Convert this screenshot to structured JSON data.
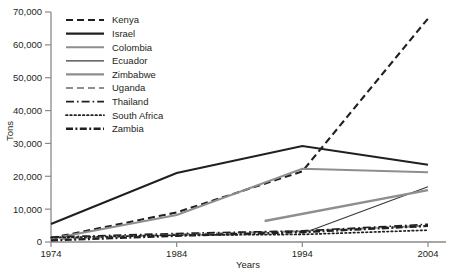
{
  "chart_data": {
    "type": "line",
    "title": "",
    "xlabel": "Years",
    "ylabel": "Tons",
    "xlim": [
      1974,
      2004
    ],
    "ylim": [
      0,
      70000
    ],
    "grid": false,
    "legend_position": "top-left-inside",
    "xticks": [
      "1974",
      "1984",
      "1994",
      "2004"
    ],
    "xtick_values": [
      1974,
      1984,
      1994,
      2004
    ],
    "yticks": [
      "0",
      "10,000",
      "20,000",
      "30,000",
      "40,000",
      "50,000",
      "60,000",
      "70,000"
    ],
    "ytick_values": [
      0,
      10000,
      20000,
      30000,
      40000,
      50000,
      60000,
      70000
    ],
    "series": [
      {
        "name": "Kenya",
        "style": "dashed",
        "color": "#231f20",
        "width": 2.1,
        "x": [
          1974,
          1984,
          1994,
          2004
        ],
        "values": [
          1200,
          9000,
          21500,
          68000
        ]
      },
      {
        "name": "Israel",
        "style": "solid",
        "color": "#231f20",
        "width": 2.1,
        "x": [
          1974,
          1984,
          1994,
          2004
        ],
        "values": [
          5500,
          21000,
          29200,
          23500
        ]
      },
      {
        "name": "Colombia",
        "style": "solid",
        "color": "#8e8e8e",
        "width": 2.0,
        "x": [
          1974,
          1984,
          1994,
          2004
        ],
        "values": [
          1000,
          8200,
          22300,
          21200
        ]
      },
      {
        "name": "Ecuador",
        "style": "solid",
        "color": "#3a3a3a",
        "width": 1.2,
        "x": [
          1994,
          2004
        ],
        "values": [
          2600,
          16800
        ]
      },
      {
        "name": "Zimbabwe",
        "style": "solid",
        "color": "#8e8e8e",
        "width": 2.4,
        "x": [
          1991,
          2004
        ],
        "values": [
          6400,
          15800
        ]
      },
      {
        "name": "Uganda",
        "style": "dashed",
        "color": "#8e8e8e",
        "width": 2.0,
        "x": [
          1974,
          1984,
          1994,
          2004
        ],
        "values": [
          900,
          2300,
          3300,
          5000
        ]
      },
      {
        "name": "Thailand",
        "style": "dash-dot",
        "color": "#231f20",
        "width": 1.6,
        "x": [
          1974,
          1984,
          1994,
          2004
        ],
        "values": [
          1500,
          2600,
          3400,
          5400
        ]
      },
      {
        "name": "South Africa",
        "style": "dotted",
        "color": "#231f20",
        "width": 1.7,
        "x": [
          1974,
          1984,
          1994,
          2004
        ],
        "values": [
          1300,
          2100,
          2300,
          3600
        ]
      },
      {
        "name": "Zambia",
        "style": "dash-dot-thick",
        "color": "#231f20",
        "width": 2.4,
        "x": [
          1974,
          1984,
          1994,
          2004
        ],
        "values": [
          500,
          1900,
          3000,
          4900
        ]
      }
    ]
  },
  "legend": {
    "items": [
      {
        "label": "Kenya"
      },
      {
        "label": "Israel"
      },
      {
        "label": "Colombia"
      },
      {
        "label": "Ecuador"
      },
      {
        "label": "Zimbabwe"
      },
      {
        "label": "Uganda"
      },
      {
        "label": "Thailand"
      },
      {
        "label": "South Africa"
      },
      {
        "label": "Zambia"
      }
    ]
  },
  "axes": {
    "y_title": "Tons",
    "x_title": "Years",
    "y_labels": [
      "70,000",
      "60,000",
      "50,000",
      "40,000",
      "30,000",
      "20,000",
      "10,000",
      "0"
    ],
    "x_labels": [
      "1974",
      "1984",
      "1994",
      "2004"
    ]
  },
  "colors": {
    "ink": "#231f20",
    "gray": "#8e8e8e",
    "axis": "#8a8a8a",
    "background": "#ffffff"
  }
}
